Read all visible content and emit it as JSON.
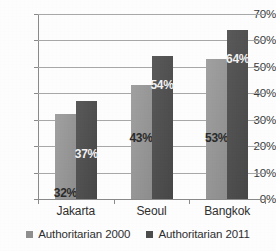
{
  "chart_data": {
    "type": "bar",
    "title": "",
    "subtitle": "",
    "xlabel": "",
    "ylabel": "",
    "categories": [
      "Jakarta",
      "Seoul",
      "Bangkok"
    ],
    "series": [
      {
        "name": "Authoritarian 2000",
        "color": "#969696",
        "values": [
          32,
          43,
          53
        ],
        "labels": [
          "32%",
          "43%",
          "53%"
        ]
      },
      {
        "name": "Authoritarian 2011",
        "color": "#4d4d4d",
        "values": [
          37,
          54,
          64
        ],
        "labels": [
          "37%",
          "54%",
          "64%"
        ]
      }
    ],
    "ylim": [
      0,
      70
    ],
    "ytick_values": [
      0,
      10,
      20,
      30,
      40,
      50,
      60,
      70
    ],
    "ytick_labels": [
      "0%",
      "10%",
      "20%",
      "30%",
      "40%",
      "50%",
      "60%",
      "70%"
    ],
    "grid": true,
    "grid_axis": "y",
    "legend_position": "bottom",
    "value_labels_inside_bars": true
  },
  "legend": {
    "items": [
      {
        "label": "Authoritarian 2000",
        "marker": "square-marker-light"
      },
      {
        "label": "Authoritarian 2011",
        "marker": "square-marker-dark"
      }
    ]
  },
  "axis": {
    "y_ticks": [
      {
        "label": "70%",
        "value": 70
      },
      {
        "label": "60%",
        "value": 60
      },
      {
        "label": "50%",
        "value": 50
      },
      {
        "label": "40%",
        "value": 40
      },
      {
        "label": "30%",
        "value": 30
      },
      {
        "label": "20%",
        "value": 20
      },
      {
        "label": "10%",
        "value": 10
      },
      {
        "label": "0%",
        "value": 0
      }
    ],
    "x_categories": [
      "Jakarta",
      "Seoul",
      "Bangkok"
    ]
  }
}
